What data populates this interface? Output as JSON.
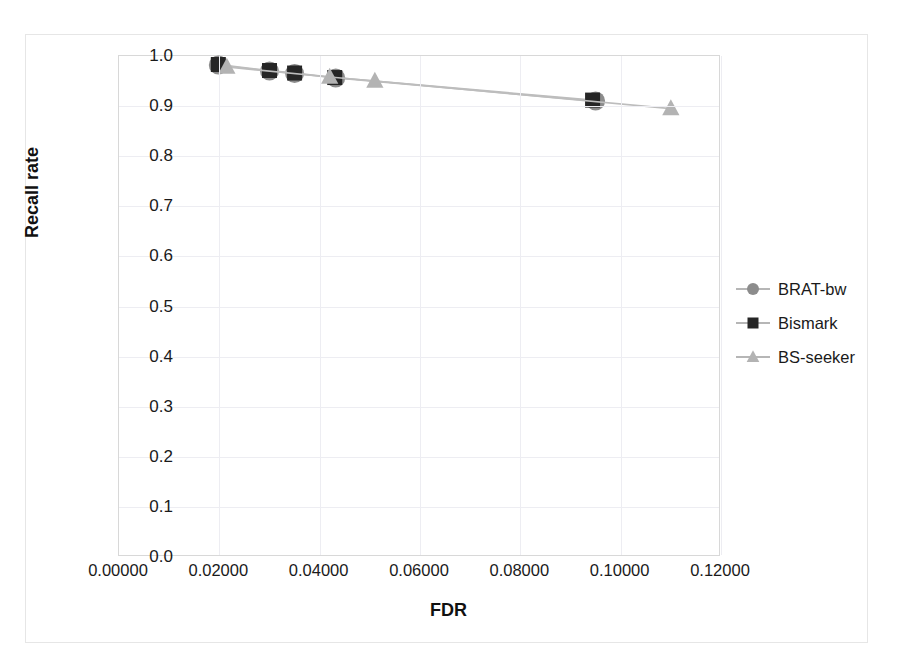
{
  "chart_data": {
    "type": "scatter",
    "title": "",
    "xlabel": "FDR",
    "ylabel": "Recall rate",
    "xlim": [
      0.0,
      0.12
    ],
    "ylim": [
      0.0,
      1.0
    ],
    "grid": true,
    "legend_position": "right",
    "xticks": [
      "0.00000",
      "0.02000",
      "0.04000",
      "0.06000",
      "0.08000",
      "0.10000",
      "0.12000"
    ],
    "xtick_values": [
      0.0,
      0.02,
      0.04,
      0.06,
      0.08,
      0.1,
      0.12
    ],
    "yticks": [
      "0.0",
      "0.1",
      "0.2",
      "0.3",
      "0.4",
      "0.5",
      "0.6",
      "0.7",
      "0.8",
      "0.9",
      "1.0"
    ],
    "ytick_values": [
      0.0,
      0.1,
      0.2,
      0.3,
      0.4,
      0.5,
      0.6,
      0.7,
      0.8,
      0.9,
      1.0
    ],
    "series": [
      {
        "name": "BRAT-bw",
        "marker": "circle",
        "color": "#8c8c8c",
        "x": [
          0.0198,
          0.03,
          0.035,
          0.0432,
          0.095
        ],
        "y": [
          0.982,
          0.97,
          0.965,
          0.956,
          0.91
        ]
      },
      {
        "name": "Bismark",
        "marker": "square",
        "color": "#262626",
        "x": [
          0.0198,
          0.03,
          0.035,
          0.043,
          0.0944
        ],
        "y": [
          0.983,
          0.971,
          0.966,
          0.957,
          0.912
        ]
      },
      {
        "name": "BS-seeker",
        "marker": "triangle",
        "color": "#b3b3b3",
        "x": [
          0.0215,
          0.042,
          0.051,
          0.11
        ],
        "y": [
          0.978,
          0.958,
          0.95,
          0.895
        ]
      }
    ]
  },
  "legend": {
    "items": [
      {
        "label": "BRAT-bw",
        "marker": "circle",
        "color": "#8c8c8c"
      },
      {
        "label": "Bismark",
        "marker": "square",
        "color": "#262626"
      },
      {
        "label": "BS-seeker",
        "marker": "triangle",
        "color": "#b3b3b3"
      }
    ]
  }
}
